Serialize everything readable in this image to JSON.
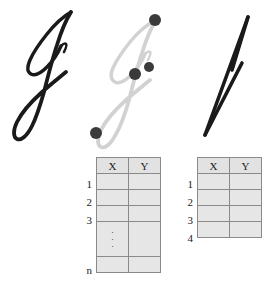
{
  "figure": {
    "caption": "",
    "panels": [
      {
        "name": "original-signature",
        "icon": "cursive-j-signature",
        "description": "Cursive capital J signature stroke drawn in black ink",
        "stroke_color": "#1a1a1a"
      },
      {
        "name": "sampled-signature",
        "icon": "cursive-j-signature-sampled",
        "description": "Same cursive J shown in light gray with four sampled point markers",
        "stroke_color": "#d2d2d2",
        "marker_color": "#3a3a3a",
        "markers": [
          {
            "label": "p1",
            "x": 153,
            "y": 25,
            "r": 6
          },
          {
            "label": "p2",
            "x": 147,
            "y": 72,
            "r": 5
          },
          {
            "label": "p3",
            "x": 133,
            "y": 79,
            "r": 6
          },
          {
            "label": "p4",
            "x": 94,
            "y": 138,
            "r": 6
          }
        ]
      },
      {
        "name": "polyline-approximation",
        "icon": "polyline-j-signature",
        "description": "Angular polyline approximation of the J signature in black ink",
        "stroke_color": "#1a1a1a"
      }
    ]
  },
  "tables": [
    {
      "name": "full-sample-table",
      "columns": [
        "X",
        "Y"
      ],
      "row_labels": [
        "1",
        "2",
        "3",
        "n"
      ],
      "has_ellipsis_row": true,
      "ellipsis": "⋮",
      "cells": [
        [
          "",
          ""
        ],
        [
          "",
          ""
        ],
        [
          "",
          ""
        ],
        [
          "",
          ""
        ]
      ]
    },
    {
      "name": "reduced-sample-table",
      "columns": [
        "X",
        "Y"
      ],
      "row_labels": [
        "1",
        "2",
        "3",
        "4"
      ],
      "has_ellipsis_row": false,
      "ellipsis": "",
      "cells": [
        [
          "",
          ""
        ],
        [
          "",
          ""
        ],
        [
          "",
          ""
        ],
        [
          "",
          ""
        ]
      ]
    }
  ],
  "colors": {
    "ink": "#1a1a1a",
    "ghost_stroke": "#d2d2d2",
    "marker": "#3a3a3a",
    "table_fill": "#e6e6e6",
    "table_border": "#8a8a8a",
    "background": "#ffffff"
  }
}
